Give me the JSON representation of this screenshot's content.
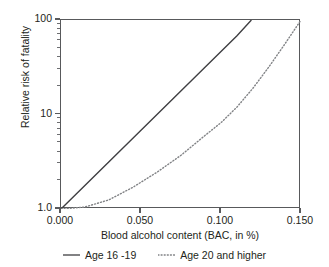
{
  "chart_data": {
    "type": "line",
    "title": "",
    "xlabel": "Blood alcohol content (BAC, in %)",
    "ylabel": "Relative risk of fatality",
    "xlim": [
      0.0,
      0.15
    ],
    "ylim": [
      1.0,
      100.0
    ],
    "yscale": "log",
    "xscale": "linear",
    "grid": false,
    "legend_position": "below",
    "xticks": [
      {
        "value": 0.0,
        "label": "0.000"
      },
      {
        "value": 0.05,
        "label": "0.050"
      },
      {
        "value": 0.1,
        "label": "0.100"
      },
      {
        "value": 0.15,
        "label": "0.150"
      }
    ],
    "yticks": [
      {
        "value": 1.0,
        "label": "1.0"
      },
      {
        "value": 10.0,
        "label": "10"
      },
      {
        "value": 100.0,
        "label": "100"
      }
    ],
    "yminorticks": [
      2,
      3,
      4,
      5,
      6,
      7,
      8,
      9,
      20,
      30,
      40,
      50,
      60,
      70,
      80,
      90
    ],
    "series": [
      {
        "name": "Age 16 -19",
        "style": "solid",
        "color": "#3f3f42",
        "x": [
          0.0,
          0.01,
          0.02,
          0.03,
          0.04,
          0.05,
          0.06,
          0.07,
          0.08,
          0.09,
          0.1,
          0.11,
          0.119
        ],
        "y": [
          1.0,
          1.47,
          2.15,
          3.16,
          4.64,
          6.81,
          10.0,
          14.68,
          21.54,
          31.62,
          46.42,
          68.13,
          100.0
        ]
      },
      {
        "name": "Age 20 and higher",
        "style": "dotted",
        "color": "#808285",
        "x": [
          0.0,
          0.015,
          0.03,
          0.045,
          0.06,
          0.075,
          0.09,
          0.1,
          0.11,
          0.12,
          0.13,
          0.14,
          0.15
        ],
        "y": [
          1.0,
          1.05,
          1.25,
          1.7,
          2.45,
          3.7,
          6.0,
          8.2,
          12.0,
          19.0,
          32.0,
          56.0,
          100.0
        ]
      }
    ]
  },
  "axes": {
    "ylabel": "Relative risk of fatality",
    "xlabel": "Blood alcohol content (BAC, in %)"
  },
  "legend": {
    "items": [
      {
        "label": "Age 16 -19",
        "style": "solid",
        "color": "#3f3f42"
      },
      {
        "label": "Age 20 and higher",
        "style": "dotted",
        "color": "#808285"
      }
    ]
  }
}
